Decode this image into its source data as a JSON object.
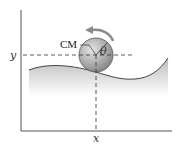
{
  "figure": {
    "labels": {
      "y_axis": "y",
      "x_axis": "x",
      "center_of_mass": "CM",
      "angle": "θ"
    },
    "colors": {
      "ball": "#9a9a9a",
      "ground_fill": "#c8c8c8",
      "axis": "#555555",
      "dashes": "#333333",
      "arrow": "#8a8a8a"
    }
  }
}
